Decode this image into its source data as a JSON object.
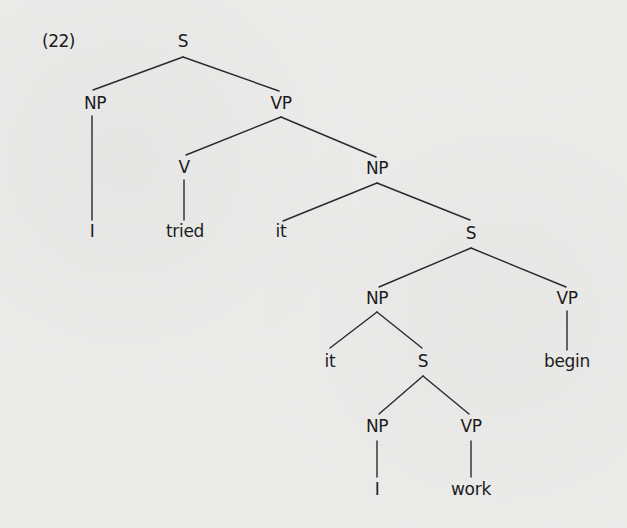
{
  "diagram": {
    "type": "syntax-tree",
    "example_number": "(22)",
    "colors": {
      "background": "#ebebea",
      "ink": "#1b1b1b",
      "lines": "#2a2a2a"
    },
    "nodes": [
      {
        "id": "n0",
        "label": "S",
        "kind": "cat",
        "x": 183,
        "y": 42
      },
      {
        "id": "n1",
        "label": "NP",
        "kind": "cat",
        "x": 95,
        "y": 104
      },
      {
        "id": "n2",
        "label": "VP",
        "kind": "cat",
        "x": 281,
        "y": 104
      },
      {
        "id": "n3",
        "label": "I",
        "kind": "word",
        "x": 92,
        "y": 232
      },
      {
        "id": "n4",
        "label": "V",
        "kind": "cat",
        "x": 184,
        "y": 168
      },
      {
        "id": "n5",
        "label": "NP",
        "kind": "cat",
        "x": 377,
        "y": 169
      },
      {
        "id": "n6",
        "label": "tried",
        "kind": "word",
        "x": 185,
        "y": 232
      },
      {
        "id": "n7",
        "label": "it",
        "kind": "word",
        "x": 281,
        "y": 232
      },
      {
        "id": "n8",
        "label": "S",
        "kind": "cat",
        "x": 471,
        "y": 234
      },
      {
        "id": "n9",
        "label": "NP",
        "kind": "cat",
        "x": 377,
        "y": 299
      },
      {
        "id": "n10",
        "label": "VP",
        "kind": "cat",
        "x": 567,
        "y": 299
      },
      {
        "id": "n11",
        "label": "it",
        "kind": "word",
        "x": 330,
        "y": 362
      },
      {
        "id": "n12",
        "label": "S",
        "kind": "cat",
        "x": 423,
        "y": 362
      },
      {
        "id": "n13",
        "label": "begin",
        "kind": "word",
        "x": 567,
        "y": 362
      },
      {
        "id": "n14",
        "label": "NP",
        "kind": "cat",
        "x": 377,
        "y": 427
      },
      {
        "id": "n15",
        "label": "VP",
        "kind": "cat",
        "x": 471,
        "y": 427
      },
      {
        "id": "n16",
        "label": "I",
        "kind": "word",
        "x": 377,
        "y": 490
      },
      {
        "id": "n17",
        "label": "work",
        "kind": "word",
        "x": 471,
        "y": 490
      }
    ],
    "edges": [
      {
        "from": "n0",
        "to": "n1",
        "x1": 183,
        "y1": 57,
        "x2": 93,
        "y2": 90
      },
      {
        "from": "n0",
        "to": "n2",
        "x1": 183,
        "y1": 57,
        "x2": 279,
        "y2": 91
      },
      {
        "from": "n1",
        "to": "n3",
        "x1": 92,
        "y1": 116,
        "x2": 92,
        "y2": 220
      },
      {
        "from": "n2",
        "to": "n4",
        "x1": 281,
        "y1": 117,
        "x2": 186,
        "y2": 155
      },
      {
        "from": "n2",
        "to": "n5",
        "x1": 281,
        "y1": 117,
        "x2": 376,
        "y2": 157
      },
      {
        "from": "n4",
        "to": "n6",
        "x1": 184,
        "y1": 180,
        "x2": 184,
        "y2": 220
      },
      {
        "from": "n5",
        "to": "n7",
        "x1": 377,
        "y1": 183,
        "x2": 283,
        "y2": 221
      },
      {
        "from": "n5",
        "to": "n8",
        "x1": 377,
        "y1": 183,
        "x2": 470,
        "y2": 220
      },
      {
        "from": "n8",
        "to": "n9",
        "x1": 471,
        "y1": 248,
        "x2": 379,
        "y2": 287
      },
      {
        "from": "n8",
        "to": "n10",
        "x1": 471,
        "y1": 248,
        "x2": 566,
        "y2": 287
      },
      {
        "from": "n9",
        "to": "n11",
        "x1": 377,
        "y1": 312,
        "x2": 330,
        "y2": 348
      },
      {
        "from": "n9",
        "to": "n12",
        "x1": 377,
        "y1": 312,
        "x2": 422,
        "y2": 348
      },
      {
        "from": "n10",
        "to": "n13",
        "x1": 567,
        "y1": 311,
        "x2": 567,
        "y2": 350
      },
      {
        "from": "n12",
        "to": "n14",
        "x1": 423,
        "y1": 376,
        "x2": 379,
        "y2": 414
      },
      {
        "from": "n12",
        "to": "n15",
        "x1": 423,
        "y1": 376,
        "x2": 469,
        "y2": 414
      },
      {
        "from": "n14",
        "to": "n16",
        "x1": 377,
        "y1": 441,
        "x2": 377,
        "y2": 477
      },
      {
        "from": "n15",
        "to": "n17",
        "x1": 471,
        "y1": 441,
        "x2": 471,
        "y2": 477
      }
    ],
    "sentence": "I tried it it I work begin"
  }
}
